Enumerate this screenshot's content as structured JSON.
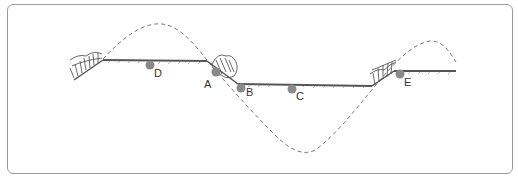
{
  "diagram": {
    "type": "river-meander-cross-section",
    "colors": {
      "frame": "#9a9a9a",
      "ground": "#555555",
      "dashed_curve": "#777777",
      "point_marker": "#8a8a8a",
      "vegetation": "#444444",
      "label": "#333333"
    },
    "points": [
      {
        "id": "D",
        "label": "D",
        "dot": [
          150,
          65
        ],
        "text": [
          154,
          77
        ]
      },
      {
        "id": "A",
        "label": "A",
        "dot": [
          216,
          72
        ],
        "text": [
          204,
          88
        ]
      },
      {
        "id": "B",
        "label": "B",
        "dot": [
          241,
          88
        ],
        "text": [
          246,
          96
        ]
      },
      {
        "id": "C",
        "label": "C",
        "dot": [
          292,
          89
        ],
        "text": [
          296,
          100
        ]
      },
      {
        "id": "E",
        "label": "E",
        "dot": [
          400,
          74
        ],
        "text": [
          404,
          86
        ]
      }
    ]
  }
}
